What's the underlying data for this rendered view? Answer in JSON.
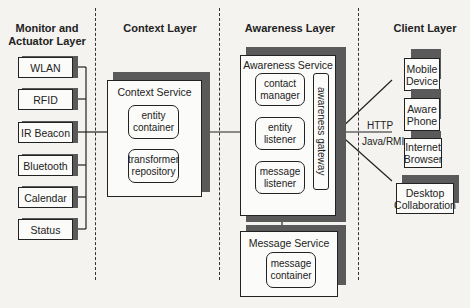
{
  "layers": {
    "monitor": {
      "title_line1": "Monitor and",
      "title_line2": "Actuator Layer"
    },
    "context": {
      "title": "Context Layer"
    },
    "awareness": {
      "title": "Awareness Layer"
    },
    "client": {
      "title": "Client Layer"
    }
  },
  "sensors": [
    {
      "label": "WLAN"
    },
    {
      "label": "RFID"
    },
    {
      "label": "IR Beacon"
    },
    {
      "label": "Bluetooth"
    },
    {
      "label": "Calendar"
    },
    {
      "label": "Status"
    }
  ],
  "context_service": {
    "title": "Context Service",
    "components": [
      {
        "line1": "entity",
        "line2": "container"
      },
      {
        "line1": "transformer",
        "line2": "repository"
      }
    ]
  },
  "awareness_service": {
    "title": "Awareness Service",
    "components": [
      {
        "line1": "contact",
        "line2": "manager"
      },
      {
        "line1": "entity",
        "line2": "listener"
      },
      {
        "line1": "message",
        "line2": "listener"
      }
    ],
    "gateway": "awareness gateway"
  },
  "message_service": {
    "title": "Message Service",
    "components": [
      {
        "line1": "message",
        "line2": "container"
      }
    ]
  },
  "clients": [
    {
      "line1": "Mobile",
      "line2": "Device"
    },
    {
      "line1": "Aware",
      "line2": "Phone"
    },
    {
      "line1": "Internet",
      "line2": "Browser"
    },
    {
      "line1": "Desktop",
      "line2": "Collaboration"
    }
  ],
  "protocols": {
    "http": "HTTP",
    "rmi": "Java/RMI"
  },
  "colors": {
    "line": "#222222",
    "shadow": "#5a5a5a",
    "background": "#f4f3ef",
    "box": "#fbfbf9"
  }
}
